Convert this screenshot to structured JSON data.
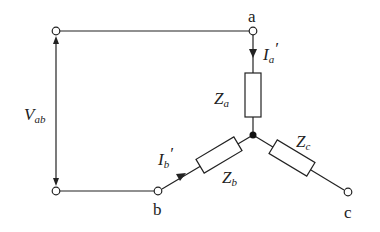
{
  "diagram": {
    "type": "Y-connected load circuit",
    "nodes": {
      "a": "a",
      "b": "b",
      "c": "c"
    },
    "voltage": {
      "symbol": "V",
      "subscript": "ab"
    },
    "currents": [
      {
        "symbol": "I",
        "subscript": "a",
        "prime": "′"
      },
      {
        "symbol": "I",
        "subscript": "b",
        "prime": "′"
      }
    ],
    "impedances": [
      {
        "symbol": "Z",
        "subscript": "a"
      },
      {
        "symbol": "Z",
        "subscript": "b"
      },
      {
        "symbol": "Z",
        "subscript": "c"
      }
    ]
  }
}
